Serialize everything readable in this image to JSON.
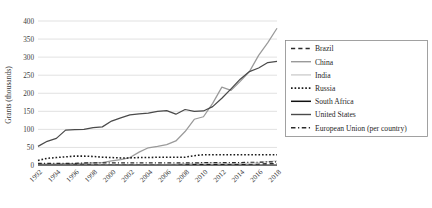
{
  "chart_data": {
    "type": "line",
    "title": "",
    "subtitle": "",
    "xlabel": "",
    "ylabel": "Grants (thousands)",
    "ylim": [
      0,
      400
    ],
    "ytick_labels": [
      "0",
      "50",
      "100",
      "150",
      "200",
      "250",
      "300",
      "350",
      "400"
    ],
    "ytick_values": [
      0,
      50,
      100,
      150,
      200,
      250,
      300,
      350,
      400
    ],
    "xlim": [
      1992,
      2018
    ],
    "xtick_labels": [
      "1992",
      "1994",
      "1996",
      "1998",
      "2000",
      "2002",
      "2004",
      "2006",
      "2008",
      "2010",
      "2012",
      "2014",
      "2016",
      "2018"
    ],
    "xtick_values": [
      1992,
      1994,
      1996,
      1998,
      2000,
      2002,
      2004,
      2006,
      2008,
      2010,
      2012,
      2014,
      2016,
      2018
    ],
    "x": [
      1992,
      1993,
      1994,
      1995,
      1996,
      1997,
      1998,
      1999,
      2000,
      2001,
      2002,
      2003,
      2004,
      2005,
      2006,
      2007,
      2008,
      2009,
      2010,
      2011,
      2012,
      2013,
      2014,
      2015,
      2016,
      2017,
      2018
    ],
    "grid": "horizontal",
    "legend_position": "right",
    "series": [
      {
        "name": "Brazil",
        "color": "#2b2b2b",
        "style": "dashed",
        "values": [
          1,
          1,
          1,
          1,
          2,
          2,
          2,
          2,
          2,
          2,
          2,
          2,
          2,
          2,
          2,
          2,
          3,
          3,
          3,
          3,
          3,
          3,
          3,
          4,
          4,
          5,
          5
        ]
      },
      {
        "name": "China",
        "color": "#9a9a9a",
        "style": "solid",
        "values": [
          4,
          4,
          4,
          5,
          5,
          6,
          7,
          8,
          13,
          16,
          22,
          37,
          49,
          53,
          58,
          68,
          94,
          128,
          135,
          172,
          217,
          208,
          233,
          260,
          305,
          340,
          380
        ]
      },
      {
        "name": "India",
        "color": "#cfcfcf",
        "style": "solid",
        "values": [
          1,
          1,
          1,
          1,
          1,
          1,
          1,
          2,
          2,
          2,
          2,
          2,
          2,
          2,
          3,
          4,
          5,
          6,
          7,
          7,
          6,
          5,
          6,
          6,
          8,
          11,
          13
        ]
      },
      {
        "name": "Russia",
        "color": "#1a1a1a",
        "style": "dotted",
        "values": [
          14,
          20,
          22,
          24,
          26,
          26,
          25,
          23,
          22,
          21,
          21,
          22,
          22,
          23,
          23,
          23,
          23,
          27,
          30,
          30,
          30,
          30,
          30,
          30,
          30,
          30,
          30
        ]
      },
      {
        "name": "South Africa",
        "color": "#111111",
        "style": "solid",
        "values": [
          1,
          1,
          1,
          1,
          1,
          1,
          1,
          1,
          1,
          1,
          1,
          1,
          1,
          1,
          1,
          1,
          1,
          1,
          1,
          1,
          1,
          1,
          1,
          1,
          1,
          1,
          1
        ]
      },
      {
        "name": "United States",
        "color": "#4a4a4a",
        "style": "solid",
        "values": [
          53,
          67,
          75,
          98,
          99,
          100,
          105,
          107,
          123,
          132,
          140,
          143,
          145,
          150,
          152,
          142,
          155,
          150,
          151,
          163,
          186,
          212,
          239,
          260,
          270,
          285,
          288
        ]
      },
      {
        "name": "European Union (per country)",
        "color": "#2b2b2b",
        "style": "dashdot",
        "values": [
          6,
          6,
          6,
          6,
          6,
          7,
          7,
          7,
          7,
          7,
          7,
          7,
          7,
          7,
          7,
          7,
          7,
          7,
          8,
          8,
          8,
          8,
          8,
          9,
          9,
          10,
          10
        ]
      }
    ]
  }
}
